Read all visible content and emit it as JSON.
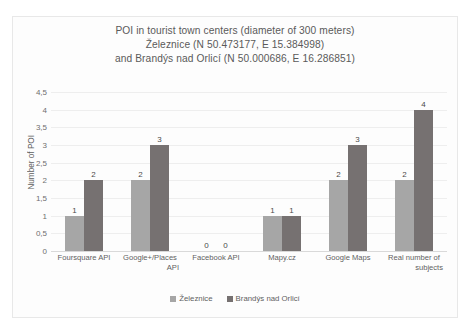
{
  "chart_data": {
    "type": "bar",
    "title": "POI in tourist town centers (diameter of 300 meters) Železnice (N 50.473177, E 15.384998) and Brandýs nad Orlicí (N 50.000686, E 16.286851)",
    "title_lines": [
      "POI in tourist town centers (diameter of 300 meters)",
      "Železnice (N 50.473177, E 15.384998)",
      "and Brandýs nad Orlicí (N 50.000686, E 16.286851)"
    ],
    "xlabel": "",
    "ylabel": "Number of POI",
    "ylim": [
      0,
      4.5
    ],
    "ytick_labels": [
      "0",
      "0,5",
      "1",
      "1,5",
      "2",
      "2,5",
      "3",
      "3,5",
      "4",
      "4,5"
    ],
    "ytick_values": [
      0,
      0.5,
      1,
      1.5,
      2,
      2.5,
      3,
      3.5,
      4,
      4.5
    ],
    "grid": true,
    "legend_position": "bottom",
    "categories": [
      "Foursquare API",
      "Google+/Places API",
      "Facebook API",
      "Mapy.cz",
      "Google Maps",
      "Real number of subjects"
    ],
    "category_lines": [
      [
        "Foursquare API"
      ],
      [
        "Google+/Places",
        "API"
      ],
      [
        "Facebook API"
      ],
      [
        "Mapy.cz"
      ],
      [
        "Google Maps"
      ],
      [
        "Real number of",
        "subjects"
      ]
    ],
    "series": [
      {
        "name": "Železnice",
        "color": "#A6A6A6",
        "values": [
          1,
          2,
          0,
          1,
          2,
          2
        ],
        "data_labels": [
          "1",
          "2",
          "0",
          "1",
          "2",
          "2"
        ]
      },
      {
        "name": "Brandýs nad Orlicí",
        "color": "#767171",
        "values": [
          2,
          3,
          0,
          1,
          3,
          4
        ],
        "data_labels": [
          "2",
          "3",
          "0",
          "1",
          "3",
          "4"
        ]
      }
    ]
  },
  "colors": {
    "series_light": "#A6A6A6",
    "series_dark": "#767171",
    "title_text": "#5A5A5A",
    "axis_text": "#5F5F5F",
    "gridline": "#EEEEEE",
    "frame_border": "#E8E8E8",
    "background": "#FFFFFF"
  }
}
